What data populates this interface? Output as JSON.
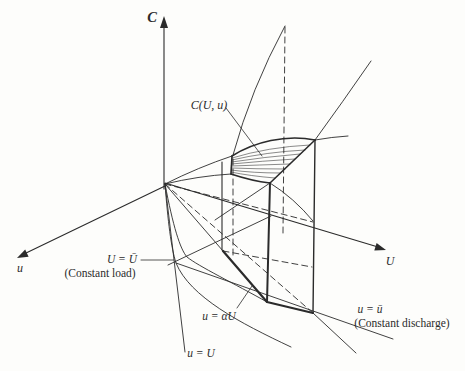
{
  "colors": {
    "ink": "#2b2b2b",
    "background": "#fdfdfb"
  },
  "figure": {
    "axis_labels": {
      "c": "C",
      "u": "u",
      "U": "U"
    },
    "surface_label": "C(U, u)",
    "annotations": {
      "constant_load": {
        "equation": "U = Ū",
        "caption": "(Constant load)"
      },
      "alpha_line": {
        "equation": "u = αU"
      },
      "identity_line": {
        "equation": "u = U"
      },
      "constant_discharge": {
        "equation": "u = ū",
        "caption": "(Constant discharge)"
      }
    }
  }
}
